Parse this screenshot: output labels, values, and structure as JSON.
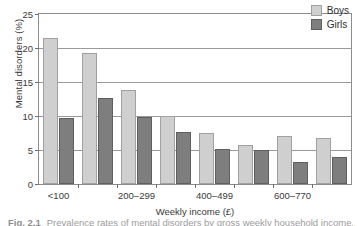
{
  "chart_data": {
    "type": "bar",
    "title": "",
    "xlabel": "Weekly income (£)",
    "ylabel": "Mental disorders (%)",
    "ylim": [
      0,
      25
    ],
    "yticks": [
      0,
      5,
      10,
      15,
      20,
      25
    ],
    "ytick_labels": [
      "0",
      "5",
      "10",
      "15",
      "20",
      "25"
    ],
    "grid": "horizontal",
    "legend_position": "top-right",
    "categories": [
      "<100",
      "100-199",
      "200-299",
      "300-399",
      "400-499",
      "500-599",
      "600-770",
      ">770"
    ],
    "xtick_labels": [
      "<100",
      "200-299",
      "400-499",
      "600-770"
    ],
    "xtick_label_indices": [
      0,
      2,
      4,
      6
    ],
    "series": [
      {
        "name": "Boys",
        "color": "#cfcfcf",
        "values": [
          21.4,
          19.3,
          13.8,
          10.0,
          7.5,
          5.8,
          7.0,
          6.8
        ]
      },
      {
        "name": "Girls",
        "color": "#7e7e7e",
        "values": [
          9.7,
          12.7,
          9.9,
          7.7,
          5.2,
          5.0,
          3.3,
          3.9
        ]
      }
    ]
  },
  "legend": {
    "items": [
      {
        "label": "Boys"
      },
      {
        "label": "Girls"
      }
    ]
  },
  "caption": {
    "figure_number": "Fig. 2.1",
    "text": "Prevalence rates of mental disorders by gross weekly household income."
  }
}
